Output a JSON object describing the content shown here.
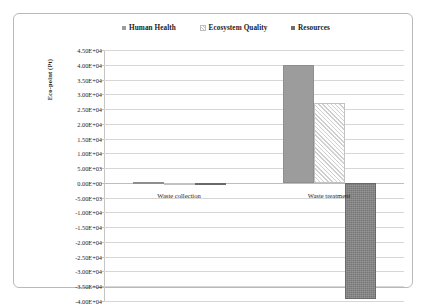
{
  "chart_data": {
    "type": "bar",
    "title": "",
    "xlabel": "",
    "ylabel": "Eco-point (Pt)",
    "categories": [
      "Waste collection",
      "Waste treatment"
    ],
    "series": [
      {
        "name": "Human Health",
        "values": [
          310,
          40000
        ],
        "style": "solid-gray"
      },
      {
        "name": "Ecosystem Quality",
        "values": [
          60,
          27000
        ],
        "style": "light-hatch"
      },
      {
        "name": "Resources",
        "values": [
          -120,
          -39300
        ],
        "style": "dark-texture"
      }
    ],
    "ylim": [
      -40000,
      45000
    ],
    "ytick_step": 5000,
    "ytick_labels": [
      "4.50E+04",
      "4.00E+04",
      "3.50E+04",
      "3.00E+04",
      "2.50E+04",
      "2.00E+04",
      "1.50E+04",
      "1.00E+04",
      "5.00E+03",
      "0.00E+00",
      "-5.00E+03",
      "-1.00E+04",
      "-1.50E+04",
      "-2.00E+04",
      "-2.50E+04",
      "-3.00E+04",
      "-3.50E+04",
      "-4.00E+04"
    ],
    "ytick_values": [
      45000,
      40000,
      35000,
      30000,
      25000,
      20000,
      15000,
      10000,
      5000,
      0,
      -5000,
      -10000,
      -15000,
      -20000,
      -25000,
      -30000,
      -35000,
      -40000
    ],
    "grid": true,
    "legend_position": "top",
    "colors": {
      "human_health": "#9c9c9c",
      "ecosystem_quality": "#fbfbfb",
      "resources": "#777777",
      "gridline": "#d6d6d6",
      "frame": "#b9b9b9",
      "text": "#1c1c1c"
    }
  },
  "legend": {
    "items": [
      {
        "label": "Human Health"
      },
      {
        "label": "Ecosystem Quality"
      },
      {
        "label": "Resources"
      }
    ]
  },
  "axis": {
    "y_title": "Eco-point (Pt)"
  }
}
